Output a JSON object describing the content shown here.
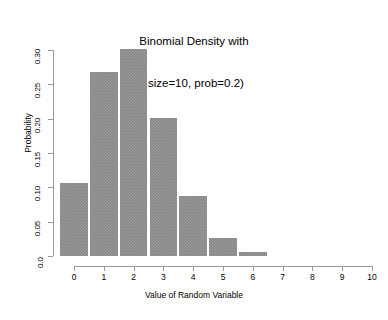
{
  "chart_data": {
    "type": "bar",
    "title": "Binomial Density with\n(size=10, prob=0.2)",
    "title_lines": [
      "Binomial Density with",
      "(size=10, prob=0.2)"
    ],
    "xlabel": "Value of Random Variable",
    "ylabel": "Probability",
    "categories": [
      "0",
      "1",
      "2",
      "3",
      "4",
      "5",
      "6",
      "7",
      "8",
      "9",
      "10"
    ],
    "x": [
      0,
      1,
      2,
      3,
      4,
      5,
      6,
      7,
      8,
      9,
      10
    ],
    "values": [
      0.107,
      0.268,
      0.302,
      0.201,
      0.088,
      0.026,
      0.006,
      0.0,
      0.0,
      0.0,
      0.0
    ],
    "bars_drawn": 7,
    "xlim": [
      -0.5,
      10.5
    ],
    "ylim": [
      0.0,
      0.3
    ],
    "xticks": [
      0,
      1,
      2,
      3,
      4,
      5,
      6,
      7,
      8,
      9,
      10
    ],
    "xtick_labels": [
      "0",
      "1",
      "2",
      "3",
      "4",
      "5",
      "6",
      "7",
      "8",
      "9",
      "10"
    ],
    "yticks": [
      0.0,
      0.05,
      0.1,
      0.15,
      0.2,
      0.25,
      0.3
    ],
    "ytick_labels": [
      "0.0",
      "0.05",
      "0.10",
      "0.15",
      "0.20",
      "0.25",
      "0.30"
    ],
    "grid": false,
    "legend": null,
    "bar_color": "#878787",
    "axis_color": "#9a9a9a",
    "background": "#ffffff"
  }
}
